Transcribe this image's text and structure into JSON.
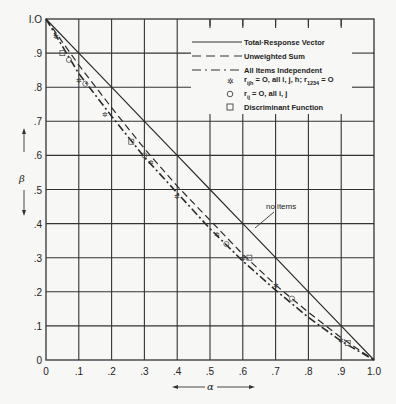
{
  "chart_data": {
    "type": "line",
    "title": "",
    "xlabel": "α",
    "ylabel": "β",
    "xlim": [
      0,
      1.0
    ],
    "ylim": [
      0,
      1.0
    ],
    "grid": true,
    "legend_position": "upper right (inset box)",
    "x_ticks": [
      "0",
      ".1",
      ".2",
      ".3",
      ".4",
      ".5",
      ".6",
      ".7",
      ".8",
      ".9",
      "1.0"
    ],
    "y_ticks": [
      "0",
      ".1",
      ".2",
      ".3",
      ".4",
      ".5",
      ".6",
      ".7",
      ".8",
      ".9",
      "1.0"
    ],
    "x": [
      0,
      0.1,
      0.2,
      0.3,
      0.4,
      0.5,
      0.6,
      0.7,
      0.8,
      0.9,
      1.0
    ],
    "series": [
      {
        "name": "Total-Response Vector",
        "style": "solid",
        "values": [
          1.0,
          0.9,
          0.8,
          0.7,
          0.6,
          0.5,
          0.4,
          0.3,
          0.2,
          0.1,
          0.0
        ]
      },
      {
        "name": "Unweighted Sum",
        "style": "dashed",
        "values": [
          1.0,
          0.865,
          0.74,
          0.62,
          0.51,
          0.41,
          0.31,
          0.22,
          0.14,
          0.065,
          0.0
        ]
      },
      {
        "name": "All Items Independent",
        "style": "dash-dot",
        "values": [
          1.0,
          0.84,
          0.715,
          0.595,
          0.49,
          0.385,
          0.29,
          0.205,
          0.125,
          0.055,
          0.0
        ]
      }
    ],
    "markers": [
      {
        "name": "r_ijh = 0, all i,j,h; r_1234 = 0",
        "symbol": "star",
        "points": [
          [
            0.03,
            0.95
          ],
          [
            0.1,
            0.82
          ],
          [
            0.18,
            0.72
          ],
          [
            0.32,
            0.58
          ],
          [
            0.4,
            0.48
          ],
          [
            0.52,
            0.37
          ],
          [
            0.6,
            0.3
          ],
          [
            0.7,
            0.22
          ],
          [
            0.9,
            0.06
          ]
        ]
      },
      {
        "name": "r_ij = 0, all i,j",
        "symbol": "circle",
        "points": [
          [
            0.07,
            0.88
          ],
          [
            0.12,
            0.81
          ],
          [
            0.3,
            0.6
          ],
          [
            0.55,
            0.34
          ],
          [
            0.75,
            0.18
          ]
        ]
      },
      {
        "name": "Discriminant Function",
        "symbol": "square",
        "points": [
          [
            0.05,
            0.9
          ],
          [
            0.26,
            0.64
          ],
          [
            0.62,
            0.3
          ],
          [
            0.92,
            0.05
          ]
        ]
      }
    ],
    "annotations": [
      {
        "text": "no items",
        "points_to": "Total-Response Vector",
        "at": [
          0.6,
          0.44
        ]
      }
    ]
  },
  "legend": {
    "items": [
      {
        "label": "Total·Response Vector",
        "style": "solid"
      },
      {
        "label": "Unweighted Sum",
        "style": "dashed"
      },
      {
        "label": "All Items Independent",
        "style": "dash-dot"
      },
      {
        "label": "r_ijh = O, all i,j,h; r_1234 = O",
        "symbol": "star"
      },
      {
        "label": "r_ij = O, all i,j",
        "symbol": "circle"
      },
      {
        "label": "Discriminant Function",
        "symbol": "square"
      }
    ],
    "l0": "Total·Response Vector",
    "l1": "Unweighted Sum",
    "l2": "All Items Independent",
    "l3a": "r",
    "l3sub": "ijh",
    "l3b": " = O,  all  i, j, h;  r",
    "l3sub2": "1234",
    "l3c": " = O",
    "l4a": "r",
    "l4sub": "ij",
    "l4b": " = O,  all  i, j",
    "l5": "Discriminant  Function"
  },
  "labels": {
    "x_axis_symbol": "α",
    "y_axis_symbol": "β",
    "no_items": "no items"
  },
  "ticks": {
    "x": [
      "0",
      ".1",
      ".2",
      ".3",
      ".4",
      ".5",
      ".6",
      ".7",
      ".8",
      ".9",
      "1.0"
    ],
    "y": [
      "0",
      ".1",
      ".2",
      ".3",
      ".4",
      ".5",
      ".6",
      ".7",
      ".8",
      ".9",
      "I.O"
    ]
  }
}
